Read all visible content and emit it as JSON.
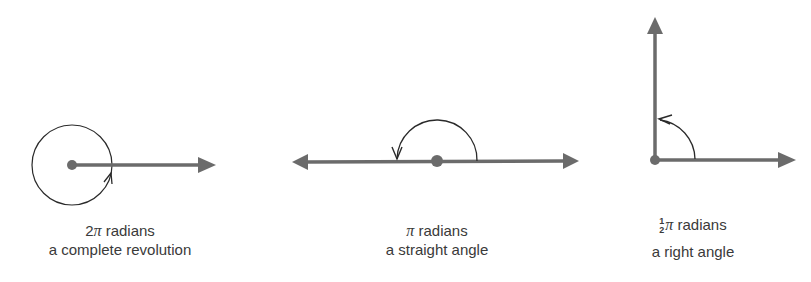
{
  "colors": {
    "arrow": "#6b6b6b",
    "arc": "#2a2a2a",
    "text": "#3a3a3a",
    "background": "#ffffff"
  },
  "panels": [
    {
      "id": "complete-revolution",
      "coefficient": "2",
      "pi_symbol": "π",
      "unit": " radians",
      "description": "a complete revolution"
    },
    {
      "id": "straight-angle",
      "coefficient": "",
      "pi_symbol": "π",
      "unit": " radians",
      "description": "a straight angle"
    },
    {
      "id": "right-angle",
      "fraction_numerator": "1",
      "fraction_denominator": "2",
      "pi_symbol": "π",
      "unit": " radians",
      "description": "a right angle"
    }
  ]
}
